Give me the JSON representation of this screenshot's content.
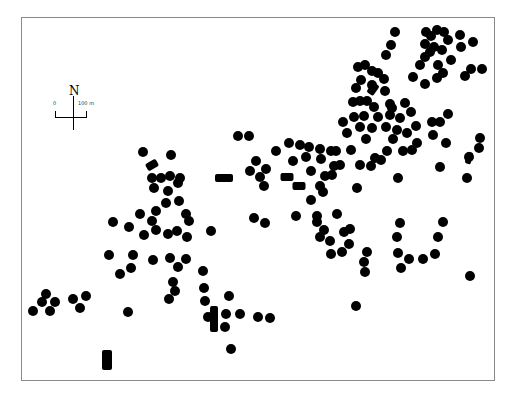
{
  "map": {
    "north_label": "N",
    "scale_start": "0",
    "scale_end": "100 m",
    "colors": {
      "feature": "#000000",
      "frame": "#8a8a8a",
      "background": "#ffffff"
    },
    "dots": [
      [
        395,
        32
      ],
      [
        391,
        45
      ],
      [
        386,
        55
      ],
      [
        426,
        32
      ],
      [
        437,
        30
      ],
      [
        431,
        36
      ],
      [
        444,
        32
      ],
      [
        425,
        44
      ],
      [
        434,
        47
      ],
      [
        425,
        57
      ],
      [
        420,
        65
      ],
      [
        430,
        52
      ],
      [
        442,
        50
      ],
      [
        448,
        40
      ],
      [
        460,
        35
      ],
      [
        473,
        42
      ],
      [
        461,
        47
      ],
      [
        451,
        60
      ],
      [
        438,
        65
      ],
      [
        443,
        73
      ],
      [
        465,
        76
      ],
      [
        471,
        69
      ],
      [
        482,
        69
      ],
      [
        437,
        78
      ],
      [
        425,
        84
      ],
      [
        413,
        77
      ],
      [
        372,
        71
      ],
      [
        365,
        65
      ],
      [
        378,
        73
      ],
      [
        358,
        67
      ],
      [
        361,
        80
      ],
      [
        356,
        88
      ],
      [
        372,
        85
      ],
      [
        384,
        79
      ],
      [
        385,
        91
      ],
      [
        360,
        101
      ],
      [
        353,
        102
      ],
      [
        367,
        101
      ],
      [
        374,
        107
      ],
      [
        390,
        104
      ],
      [
        405,
        103
      ],
      [
        411,
        112
      ],
      [
        390,
        115
      ],
      [
        400,
        118
      ],
      [
        378,
        117
      ],
      [
        364,
        116
      ],
      [
        354,
        117
      ],
      [
        343,
        122
      ],
      [
        347,
        133
      ],
      [
        360,
        127
      ],
      [
        366,
        139
      ],
      [
        372,
        128
      ],
      [
        386,
        127
      ],
      [
        393,
        139
      ],
      [
        397,
        130
      ],
      [
        407,
        133
      ],
      [
        416,
        126
      ],
      [
        432,
        122
      ],
      [
        440,
        122
      ],
      [
        448,
        114
      ],
      [
        403,
        151
      ],
      [
        412,
        150
      ],
      [
        417,
        143
      ],
      [
        387,
        151
      ],
      [
        375,
        158
      ],
      [
        381,
        160
      ],
      [
        371,
        166
      ],
      [
        360,
        165
      ],
      [
        357,
        188
      ],
      [
        398,
        178
      ],
      [
        351,
        150
      ],
      [
        336,
        151
      ],
      [
        340,
        165
      ],
      [
        332,
        175
      ],
      [
        440,
        167
      ],
      [
        467,
        178
      ],
      [
        480,
        138
      ],
      [
        479,
        148
      ],
      [
        469,
        157
      ],
      [
        446,
        143
      ],
      [
        392,
        108
      ],
      [
        433,
        135
      ],
      [
        238,
        136
      ],
      [
        249,
        136
      ],
      [
        276,
        151
      ],
      [
        289,
        143
      ],
      [
        300,
        145
      ],
      [
        309,
        147
      ],
      [
        320,
        149
      ],
      [
        331,
        151
      ],
      [
        293,
        161
      ],
      [
        306,
        157
      ],
      [
        321,
        159
      ],
      [
        334,
        166
      ],
      [
        311,
        171
      ],
      [
        325,
        176
      ],
      [
        320,
        186
      ],
      [
        323,
        192
      ],
      [
        311,
        200
      ],
      [
        256,
        161
      ],
      [
        266,
        169
      ],
      [
        260,
        177
      ],
      [
        264,
        186
      ],
      [
        250,
        171
      ],
      [
        296,
        216
      ],
      [
        317,
        216
      ],
      [
        337,
        214
      ],
      [
        324,
        230
      ],
      [
        317,
        222
      ],
      [
        320,
        237
      ],
      [
        330,
        241
      ],
      [
        344,
        232
      ],
      [
        350,
        229
      ],
      [
        349,
        244
      ],
      [
        342,
        252
      ],
      [
        331,
        254
      ],
      [
        367,
        252
      ],
      [
        364,
        262
      ],
      [
        365,
        272
      ],
      [
        400,
        223
      ],
      [
        397,
        237
      ],
      [
        398,
        253
      ],
      [
        401,
        268
      ],
      [
        409,
        259
      ],
      [
        423,
        259
      ],
      [
        435,
        254
      ],
      [
        438,
        237
      ],
      [
        443,
        222
      ],
      [
        470,
        276
      ],
      [
        254,
        218
      ],
      [
        265,
        223
      ],
      [
        143,
        152
      ],
      [
        171,
        155
      ],
      [
        152,
        178
      ],
      [
        161,
        178
      ],
      [
        170,
        176
      ],
      [
        178,
        183
      ],
      [
        154,
        188
      ],
      [
        168,
        191
      ],
      [
        180,
        178
      ],
      [
        166,
        203
      ],
      [
        179,
        201
      ],
      [
        186,
        214
      ],
      [
        189,
        221
      ],
      [
        156,
        211
      ],
      [
        140,
        214
      ],
      [
        152,
        221
      ],
      [
        156,
        230
      ],
      [
        168,
        234
      ],
      [
        177,
        231
      ],
      [
        187,
        237
      ],
      [
        113,
        222
      ],
      [
        129,
        227
      ],
      [
        144,
        235
      ],
      [
        211,
        231
      ],
      [
        109,
        255
      ],
      [
        133,
        255
      ],
      [
        120,
        274
      ],
      [
        131,
        268
      ],
      [
        153,
        260
      ],
      [
        170,
        258
      ],
      [
        186,
        259
      ],
      [
        178,
        267
      ],
      [
        173,
        282
      ],
      [
        175,
        291
      ],
      [
        169,
        299
      ],
      [
        203,
        271
      ],
      [
        204,
        288
      ],
      [
        205,
        301
      ],
      [
        128,
        312
      ],
      [
        229,
        296
      ],
      [
        226,
        314
      ],
      [
        225,
        327
      ],
      [
        240,
        314
      ],
      [
        258,
        317
      ],
      [
        270,
        318
      ],
      [
        231,
        349
      ],
      [
        356,
        306
      ],
      [
        208,
        317
      ],
      [
        46,
        294
      ],
      [
        42,
        302
      ],
      [
        33,
        311
      ],
      [
        50,
        311
      ],
      [
        55,
        302
      ],
      [
        73,
        299
      ],
      [
        86,
        296
      ],
      [
        80,
        308
      ]
    ],
    "rects": [
      {
        "x": 152,
        "y": 165,
        "w": 12,
        "h": 8,
        "rot": -30
      },
      {
        "x": 224,
        "y": 178,
        "w": 18,
        "h": 8,
        "rot": 0
      },
      {
        "x": 287,
        "y": 177,
        "w": 13,
        "h": 8,
        "rot": 0
      },
      {
        "x": 299,
        "y": 186,
        "w": 13,
        "h": 8,
        "rot": 0
      },
      {
        "x": 373,
        "y": 89,
        "w": 8,
        "h": 12,
        "rot": 35
      },
      {
        "x": 469,
        "y": 158,
        "w": 6,
        "h": 12,
        "rot": 15
      },
      {
        "x": 214,
        "y": 319,
        "w": 8,
        "h": 26,
        "rot": 0
      },
      {
        "x": 107,
        "y": 360,
        "w": 10,
        "h": 20,
        "rot": 0
      }
    ]
  }
}
